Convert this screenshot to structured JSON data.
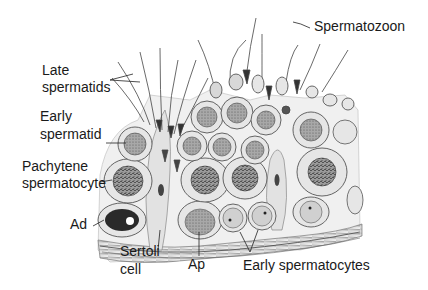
{
  "figure": {
    "colors": {
      "background": "#ffffff",
      "ink": "#1a1a1a",
      "cytoplasm": "#e6e6e6",
      "nucleus": "#8c8c8c",
      "dark_nucleus": "#2a2a2a",
      "basement": "#9a9a9a"
    }
  },
  "labels": {
    "spermatozoon": "Spermatozoon",
    "late_spermatids_line1": "Late",
    "late_spermatids_line2": "spermatids",
    "early_spermatid_line1": "Early",
    "early_spermatid_line2": "spermatid",
    "pachytene_line1": "Pachytene",
    "pachytene_line2": "spermatocyte",
    "ad": "Ad",
    "sertoli_line1": "Sertoli",
    "sertoli_line2": "cell",
    "ap": "Ap",
    "early_spermatocytes": "Early spermatocytes"
  }
}
